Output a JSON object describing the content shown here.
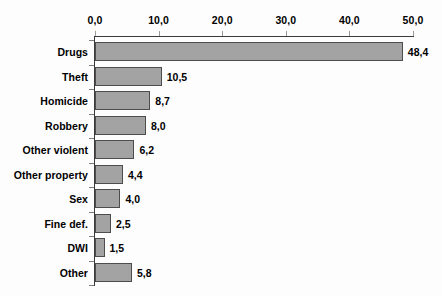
{
  "chart_data": {
    "type": "bar",
    "orientation": "horizontal",
    "title": "",
    "subtitle": "",
    "xlabel": "",
    "ylabel": "",
    "xlim": [
      0.0,
      50.0
    ],
    "grid": false,
    "legend": null,
    "axis_position": "top",
    "decimal_separator": ",",
    "xticks": [
      "0,0",
      "10,0",
      "20,0",
      "30,0",
      "40,0",
      "50,0"
    ],
    "xtick_values": [
      0.0,
      10.0,
      20.0,
      30.0,
      40.0,
      50.0
    ],
    "categories": [
      "Drugs",
      "Theft",
      "Homicide",
      "Robbery",
      "Other violent",
      "Other property",
      "Sex",
      "Fine def.",
      "DWI",
      "Other"
    ],
    "values": [
      48.4,
      10.5,
      8.7,
      8.0,
      6.2,
      4.4,
      4.0,
      2.5,
      1.5,
      5.8
    ],
    "value_labels": [
      "48,4",
      "10,5",
      "8,7",
      "8,0",
      "6,2",
      "4,4",
      "4,0",
      "2,5",
      "1,5",
      "5,8"
    ],
    "colors": {
      "bar_fill": "#a3a3a3",
      "bar_border": "#4d4d4d",
      "axis": "#3a3a3a",
      "text": "#000000",
      "background": "#fdfdfd"
    }
  }
}
